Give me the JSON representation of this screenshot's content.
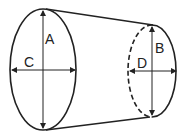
{
  "diagram": {
    "type": "truncated-cone",
    "labels": {
      "A": "A",
      "B": "B",
      "C": "C",
      "D": "D"
    },
    "stroke": "#222222",
    "background": "#ffffff"
  }
}
